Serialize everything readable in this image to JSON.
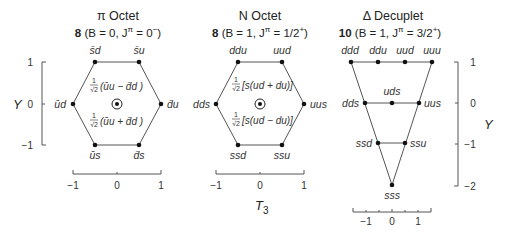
{
  "panels": [
    {
      "id": "pi-octet",
      "title": "π Octet",
      "subtitle_bold": "8",
      "subtitle_rest": " (B = 0, J",
      "subtitle_sup": "π",
      "subtitle_end": " = 0",
      "subtitle_end_sup": "−",
      "subtitle_close": ")",
      "vertices": {
        "top_left": "s̄d",
        "top_right": "s̄u",
        "mid_left": "ūd",
        "mid_right": "d̄u",
        "bottom_left": "ūs",
        "bottom_right": "d̄s"
      },
      "center_upper": "(ūu − d̄d )",
      "center_lower": "(ūu + d̄d )",
      "frac_num": "1",
      "frac_den": "√2",
      "x_ticks": [
        "−1",
        "0",
        "1"
      ]
    },
    {
      "id": "n-octet",
      "title": "N Octet",
      "subtitle_bold": "8",
      "subtitle_rest": " (B = 1, J",
      "subtitle_sup": "π",
      "subtitle_end": " = 1/2",
      "subtitle_end_sup": "+",
      "subtitle_close": ")",
      "vertices": {
        "top_left": "ddu",
        "top_right": "uud",
        "mid_left": "dds",
        "mid_right": "uus",
        "bottom_left": "ssd",
        "bottom_right": "ssu"
      },
      "center_upper": "[s(ud + du)]",
      "center_lower": "[s(ud − du)]",
      "frac_num": "1",
      "frac_den": "√2",
      "x_ticks": [
        "−1",
        "0",
        "1"
      ],
      "x_axis_label": "T",
      "x_axis_sub": "3"
    },
    {
      "id": "delta-decuplet",
      "title": "Δ Decuplet",
      "subtitle_bold": "10",
      "subtitle_rest": " (B = 1, J",
      "subtitle_sup": "π",
      "subtitle_end": " = 3/2",
      "subtitle_end_sup": "+",
      "subtitle_close": ")",
      "row1": [
        "ddd",
        "ddu",
        "uud",
        "uuu"
      ],
      "row2": [
        "dds",
        "uds",
        "uus"
      ],
      "row3": [
        "ssd",
        "ssu"
      ],
      "row4": [
        "sss"
      ],
      "x_ticks": [
        "−1",
        "0",
        "1"
      ]
    }
  ],
  "left_y_axis": {
    "label": "Y",
    "ticks": [
      "1",
      "0",
      "−1"
    ]
  },
  "right_y_axis": {
    "label": "Y",
    "ticks": [
      "1",
      "0",
      "−1",
      "−2"
    ]
  }
}
